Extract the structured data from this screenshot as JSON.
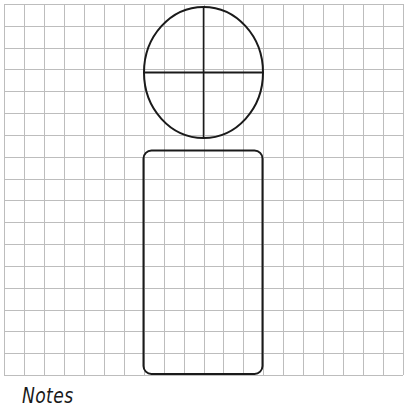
{
  "grid": {
    "left": 4,
    "top": 4,
    "right": 403,
    "bottom": 375,
    "columns": 20,
    "rows": 17,
    "line_color": "#bdbdbd"
  },
  "shapes": {
    "head": {
      "cx": 203.5,
      "cy": 72.5,
      "rx": 59.5,
      "ry": 65.5,
      "stroke": "#1a1a1a"
    },
    "head_crosshair": {
      "stroke": "#1a1a1a"
    },
    "body": {
      "x": 143.5,
      "y": 150.5,
      "width": 119,
      "height": 223.5,
      "radius": 8,
      "stroke": "#1a1a1a"
    }
  },
  "labels": {
    "notes": "Notes"
  }
}
